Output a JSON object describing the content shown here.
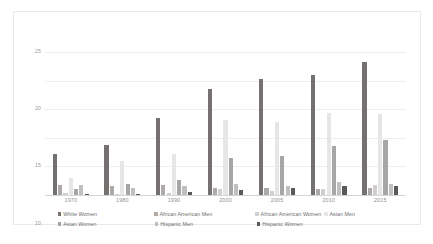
{
  "chart_data": {
    "type": "bar",
    "title": "",
    "xlabel": "",
    "ylabel": "",
    "categories": [
      "1970",
      "1980",
      "1990",
      "2000",
      "2005",
      "2010",
      "2015"
    ],
    "ylim": [
      0,
      25
    ],
    "yticks": [
      "0",
      "5",
      "10",
      "15",
      "20",
      "25"
    ],
    "grid": true,
    "legend_position": "bottom",
    "series": [
      {
        "name": "White Women",
        "color": "#767171",
        "values": [
          7.1,
          8.8,
          13.5,
          18.5,
          20.2,
          21.0,
          23.2
        ]
      },
      {
        "name": "African American Men",
        "color": "#aeaaaa",
        "values": [
          1.8,
          1.6,
          1.7,
          1.2,
          1.2,
          1.1,
          1.3
        ]
      },
      {
        "name": "African American Women",
        "color": "#d0cece",
        "values": [
          0.3,
          0.2,
          0.4,
          1.0,
          0.7,
          1.0,
          1.7
        ]
      },
      {
        "name": "Asian Men",
        "color": "#e7e6e6",
        "values": [
          2.9,
          5.9,
          7.1,
          13.1,
          12.8,
          14.4,
          14.1
        ]
      },
      {
        "name": "Asian Women",
        "color": "#a6a6a6",
        "values": [
          1.0,
          2.0,
          2.6,
          6.5,
          6.8,
          8.6,
          9.7
        ]
      },
      {
        "name": "Hispanic Men",
        "color": "#bfbfbf",
        "values": [
          1.8,
          1.3,
          1.6,
          1.9,
          1.5,
          2.3,
          1.9
        ]
      },
      {
        "name": "Hispanic Women",
        "color": "#595959",
        "values": [
          0.05,
          0.2,
          0.5,
          0.9,
          1.2,
          1.6,
          1.5
        ]
      }
    ]
  },
  "legend": {
    "row1": [
      "White Women",
      "African American Men",
      "African American Women",
      "Asian Men"
    ],
    "row2": [
      "Asian Women",
      "Hispanic Men",
      "Hispanic Women"
    ]
  },
  "caption": {
    "text": ""
  }
}
